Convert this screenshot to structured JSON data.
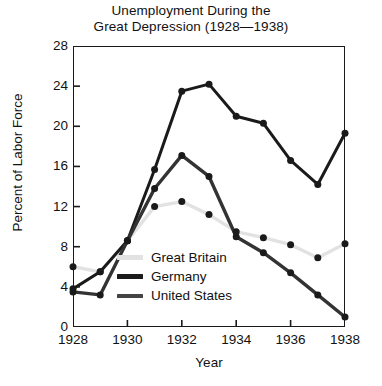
{
  "chart_data": {
    "type": "line",
    "title_line1": "Unemployment During the",
    "title_line2": "Great Depression (1928—1938)",
    "xlabel": "Year",
    "ylabel": "Percent of Labor Force",
    "xlim": [
      1928,
      1938
    ],
    "ylim": [
      0,
      28
    ],
    "xticks": [
      1928,
      1930,
      1932,
      1934,
      1936,
      1938
    ],
    "xtick_labels": [
      "1928",
      "1930",
      "1932",
      "1934",
      "1936",
      "1938"
    ],
    "yticks": [
      0,
      4,
      8,
      12,
      16,
      20,
      24,
      28
    ],
    "ytick_labels": [
      "0",
      "4",
      "8",
      "12",
      "16",
      "20",
      "24",
      "28"
    ],
    "grid": false,
    "legend_position": "center-left-inside",
    "markers": "filled-circle",
    "x": [
      1928,
      1929,
      1930,
      1931,
      1932,
      1933,
      1934,
      1935,
      1936,
      1937,
      1938
    ],
    "series": [
      {
        "name": "Great Britain",
        "color": "#e2e2e2",
        "width": 3.4,
        "marker_color": "#1a1a1a",
        "values": [
          6.0,
          5.5,
          8.6,
          12.0,
          12.5,
          11.2,
          9.5,
          8.9,
          8.2,
          6.9,
          8.3
        ]
      },
      {
        "name": "Germany",
        "color": "#1a1a1a",
        "width": 3.0,
        "marker_color": "#1a1a1a",
        "values": [
          3.8,
          5.5,
          8.6,
          15.7,
          23.5,
          24.2,
          21.0,
          20.3,
          16.6,
          14.2,
          19.3
        ]
      },
      {
        "name": "United States",
        "color": "#333333",
        "width": 3.4,
        "marker_color": "#1a1a1a",
        "values": [
          3.5,
          3.2,
          8.6,
          13.8,
          17.1,
          15.0,
          9.0,
          7.4,
          5.4,
          3.2,
          1.0
        ]
      }
    ]
  },
  "legend": {
    "items": [
      {
        "label": "Great Britain",
        "swatch": "#e2e2e2"
      },
      {
        "label": "Germany",
        "swatch": "#1a1a1a"
      },
      {
        "label": "United States",
        "swatch": "#444444"
      }
    ]
  },
  "axis_colors": {
    "frame": "#1a1a1a",
    "text": "#111111"
  }
}
